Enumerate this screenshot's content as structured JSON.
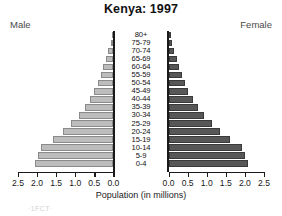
{
  "chart_data": {
    "type": "bar",
    "subtype": "population-pyramid",
    "title": "Kenya: 1997",
    "xlabel": "Population (in millions)",
    "ylabel": "",
    "left_series_label": "Male",
    "right_series_label": "Female",
    "categories": [
      "0-4",
      "5-9",
      "10-14",
      "15-19",
      "20-24",
      "25-29",
      "30-34",
      "35-39",
      "40-44",
      "45-49",
      "50-54",
      "55-59",
      "60-64",
      "65-69",
      "70-74",
      "75-79",
      "80+"
    ],
    "series": [
      {
        "name": "Male",
        "side": "left",
        "color": "#bcbcbc",
        "values": [
          2.05,
          1.98,
          1.9,
          1.58,
          1.32,
          1.1,
          0.9,
          0.74,
          0.61,
          0.5,
          0.41,
          0.33,
          0.26,
          0.19,
          0.13,
          0.07,
          0.04
        ]
      },
      {
        "name": "Female",
        "side": "right",
        "color": "#575757",
        "values": [
          2.08,
          2.0,
          1.93,
          1.62,
          1.36,
          1.13,
          0.92,
          0.76,
          0.63,
          0.52,
          0.43,
          0.35,
          0.28,
          0.21,
          0.15,
          0.09,
          0.05
        ]
      }
    ],
    "xlim_left": [
      2.5,
      0.0
    ],
    "xlim_right": [
      0.0,
      2.5
    ],
    "left_ticks": [
      "2.5",
      "2.0",
      "1.5",
      "1.0",
      "0.5",
      "0.0"
    ],
    "right_ticks": [
      "0.0",
      "0.5",
      "1.0",
      "1.5",
      "2.0",
      "2.5"
    ],
    "left_tick_values": [
      2.5,
      2.0,
      1.5,
      1.0,
      0.5,
      0.0
    ],
    "right_tick_values": [
      0.0,
      0.5,
      1.0,
      1.5,
      2.0,
      2.5
    ],
    "grid": false,
    "legend": "inline-side-labels"
  },
  "footer": {
    "partial_text": "·1FCT·"
  }
}
